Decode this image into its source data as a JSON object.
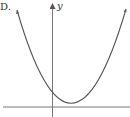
{
  "figure": {
    "option_label": "D.",
    "y_axis_label": "y",
    "colors": {
      "curve": "#555555",
      "axes": "#666666"
    }
  }
}
